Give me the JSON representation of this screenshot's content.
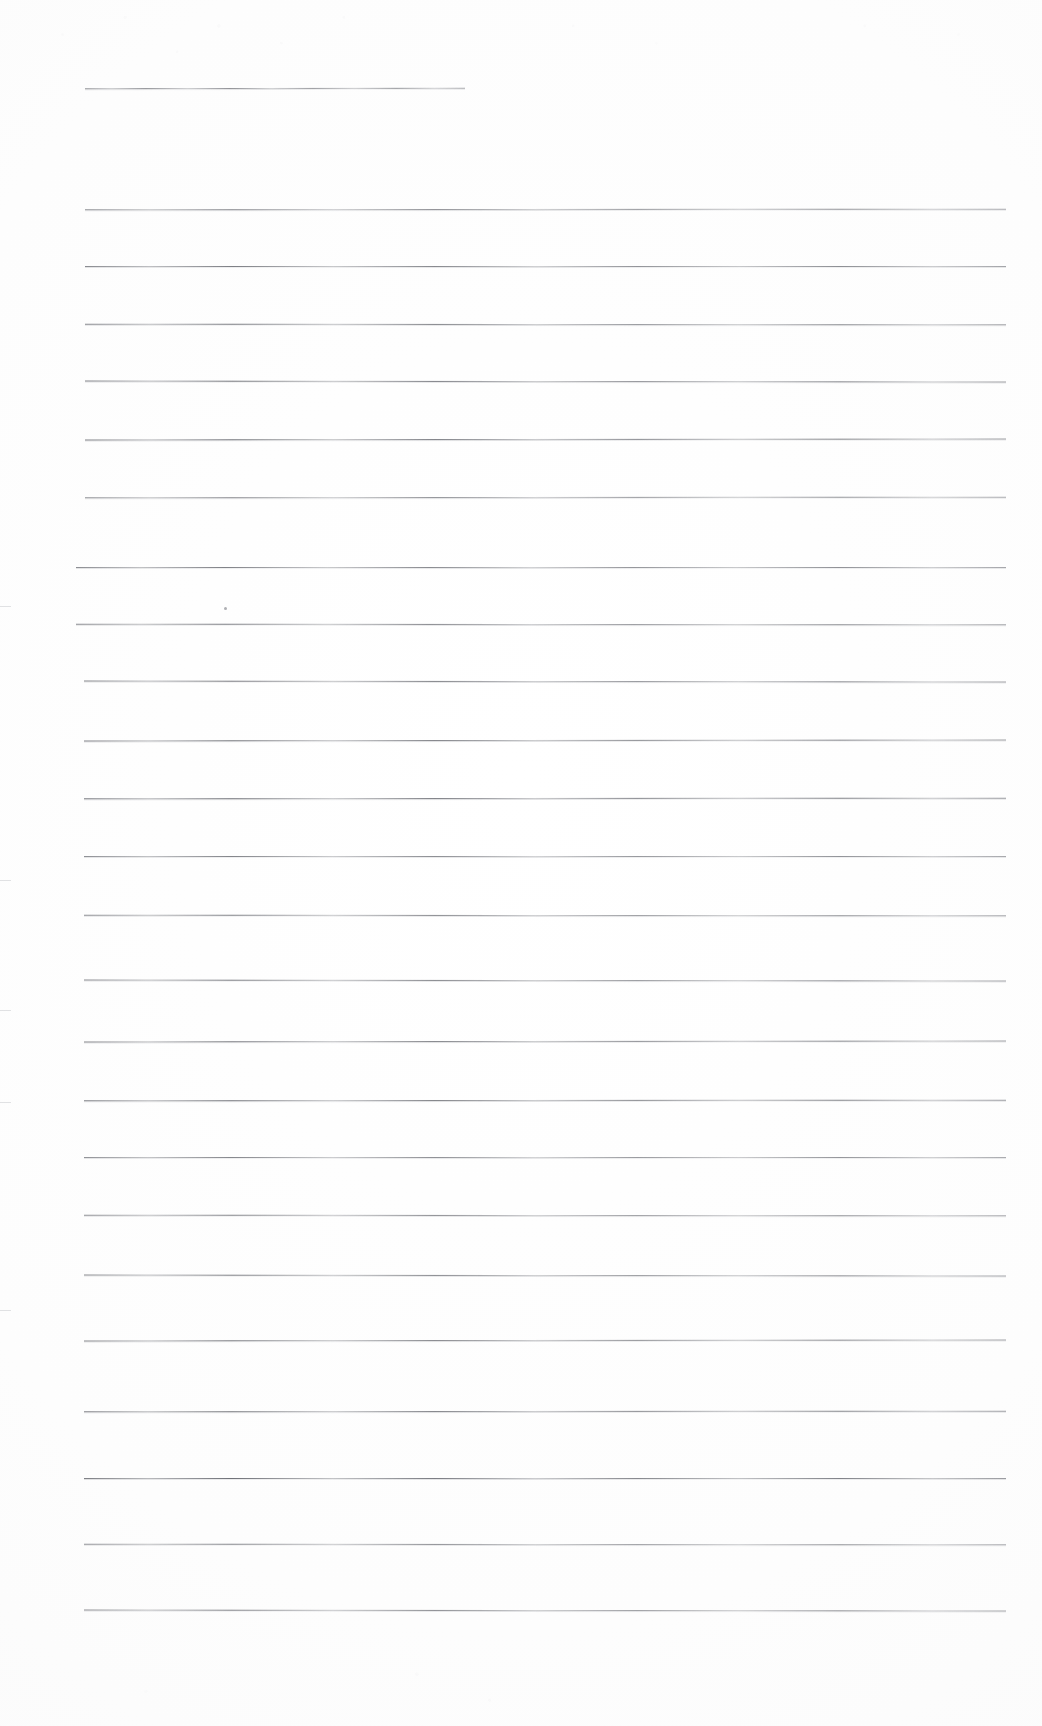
{
  "page": {
    "kind": "scanned-ruled-sheet",
    "width": 1042,
    "height": 1726,
    "background_color": "#fefefe",
    "paper_tone_color": "#fbfbfb",
    "rule_color": "#5f6168",
    "content_text": ""
  },
  "ruling": {
    "line_count": 26,
    "left_margin_x": 85,
    "right_edge_x": 1005,
    "first_line_right_edge_x": 465,
    "spacing_px": 57,
    "lines": [
      {
        "y": 88,
        "x1": 85,
        "x2": 465,
        "short": true
      },
      {
        "y": 209,
        "x1": 85,
        "x2": 1006,
        "short": false
      },
      {
        "y": 266,
        "x1": 85,
        "x2": 1006,
        "short": false
      },
      {
        "y": 324,
        "x1": 85,
        "x2": 1006,
        "short": false
      },
      {
        "y": 381,
        "x1": 85,
        "x2": 1006,
        "short": false
      },
      {
        "y": 439,
        "x1": 85,
        "x2": 1006,
        "short": false
      },
      {
        "y": 497,
        "x1": 85,
        "x2": 1006,
        "short": false
      },
      {
        "y": 567,
        "x1": 76,
        "x2": 1006,
        "short": false
      },
      {
        "y": 624,
        "x1": 76,
        "x2": 1006,
        "short": false
      },
      {
        "y": 681,
        "x1": 84,
        "x2": 1006,
        "short": false
      },
      {
        "y": 740,
        "x1": 84,
        "x2": 1006,
        "short": false
      },
      {
        "y": 798,
        "x1": 84,
        "x2": 1006,
        "short": false
      },
      {
        "y": 856,
        "x1": 84,
        "x2": 1006,
        "short": false
      },
      {
        "y": 915,
        "x1": 84,
        "x2": 1006,
        "short": false
      },
      {
        "y": 980,
        "x1": 84,
        "x2": 1006,
        "short": false
      },
      {
        "y": 1041,
        "x1": 84,
        "x2": 1006,
        "short": false
      },
      {
        "y": 1100,
        "x1": 84,
        "x2": 1006,
        "short": false
      },
      {
        "y": 1157,
        "x1": 84,
        "x2": 1006,
        "short": false
      },
      {
        "y": 1215,
        "x1": 84,
        "x2": 1006,
        "short": false
      },
      {
        "y": 1275,
        "x1": 84,
        "x2": 1006,
        "short": false
      },
      {
        "y": 1340,
        "x1": 84,
        "x2": 1006,
        "short": false
      },
      {
        "y": 1411,
        "x1": 84,
        "x2": 1006,
        "short": false
      },
      {
        "y": 1478,
        "x1": 84,
        "x2": 1006,
        "short": false
      },
      {
        "y": 1544,
        "x1": 84,
        "x2": 1006,
        "short": false
      },
      {
        "y": 1610,
        "x1": 84,
        "x2": 1006,
        "short": false
      }
    ]
  },
  "artifacts": {
    "edge_ticks_y": [
      606,
      880,
      1010,
      1102,
      1310
    ],
    "specks": [
      {
        "x": 224,
        "y": 607
      }
    ]
  }
}
